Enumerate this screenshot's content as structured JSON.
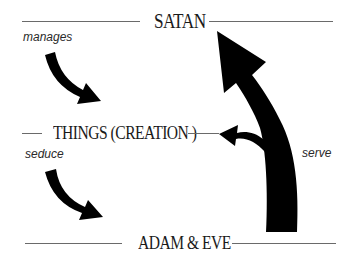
{
  "diagram": {
    "levels": [
      {
        "id": "satan",
        "label": "SATAN"
      },
      {
        "id": "things",
        "label": "THINGS (CREATION )"
      },
      {
        "id": "adam_eve",
        "label": "ADAM & EVE"
      }
    ],
    "relations": [
      {
        "label": "manages",
        "from": "SATAN",
        "to": "THINGS (CREATION )"
      },
      {
        "label": "seduce",
        "from": "THINGS (CREATION )",
        "to": "ADAM & EVE"
      },
      {
        "label": "serve",
        "from": "ADAM & EVE",
        "to": "SATAN"
      }
    ],
    "colors": {
      "arrow": "#000000",
      "line": "#6a6a6a",
      "text": "#1a1a1a",
      "background": "#ffffff"
    }
  }
}
